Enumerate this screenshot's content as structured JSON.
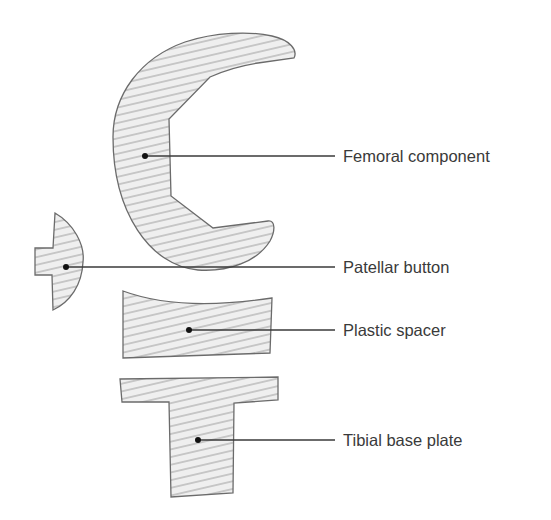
{
  "diagram": {
    "type": "labeled-anatomy-diagram",
    "colors": {
      "fill": "#efefef",
      "hatch": "#8a8a8a",
      "outline": "#6b6b6b",
      "leader": "#3a3a3a",
      "text": "#3a3a3a"
    },
    "labels": [
      {
        "id": "femoral",
        "text": "Femoral component",
        "anchor": [
          145,
          156
        ],
        "line_end": [
          335,
          156
        ],
        "text_pos": [
          343,
          162
        ]
      },
      {
        "id": "patellar",
        "text": "Patellar button",
        "anchor": [
          66,
          267
        ],
        "line_end": [
          335,
          267
        ],
        "text_pos": [
          343,
          273
        ]
      },
      {
        "id": "spacer",
        "text": "Plastic spacer",
        "anchor": [
          189,
          330
        ],
        "line_end": [
          335,
          330
        ],
        "text_pos": [
          343,
          336
        ]
      },
      {
        "id": "tibial",
        "text": "Tibial base plate",
        "anchor": [
          198,
          440
        ],
        "line_end": [
          335,
          440
        ],
        "text_pos": [
          343,
          446
        ]
      }
    ]
  }
}
